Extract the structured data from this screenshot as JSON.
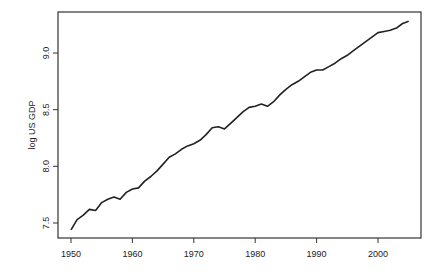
{
  "chart_data": {
    "type": "line",
    "title": "",
    "xlabel": "",
    "ylabel": "log US GDP",
    "xlim": [
      1948,
      2007
    ],
    "ylim": [
      7.37,
      9.36
    ],
    "grid": false,
    "legend": null,
    "x_ticks": [
      1950,
      1960,
      1970,
      1980,
      1990,
      2000
    ],
    "x_tick_labels": [
      "1950",
      "1960",
      "1970",
      "1980",
      "1990",
      "2000"
    ],
    "y_ticks": [
      7.5,
      8.0,
      8.5,
      9.0
    ],
    "y_tick_labels": [
      "7.5",
      "8.0",
      "8.5",
      "9.0"
    ],
    "series": [
      {
        "name": "log US GDP",
        "color": "#222222",
        "x": [
          1950,
          1951,
          1952,
          1953,
          1954,
          1955,
          1956,
          1957,
          1958,
          1959,
          1960,
          1961,
          1962,
          1963,
          1964,
          1965,
          1966,
          1967,
          1968,
          1969,
          1970,
          1971,
          1972,
          1973,
          1974,
          1975,
          1976,
          1977,
          1978,
          1979,
          1980,
          1981,
          1982,
          1983,
          1984,
          1985,
          1986,
          1987,
          1988,
          1989,
          1990,
          1991,
          1992,
          1993,
          1994,
          1995,
          1996,
          1997,
          1998,
          1999,
          2000,
          2001,
          2002,
          2003,
          2004,
          2005
        ],
        "values": [
          7.44,
          7.53,
          7.57,
          7.62,
          7.61,
          7.68,
          7.71,
          7.73,
          7.71,
          7.77,
          7.8,
          7.81,
          7.87,
          7.91,
          7.96,
          8.02,
          8.08,
          8.11,
          8.15,
          8.18,
          8.2,
          8.23,
          8.28,
          8.34,
          8.35,
          8.33,
          8.38,
          8.43,
          8.48,
          8.52,
          8.53,
          8.55,
          8.53,
          8.57,
          8.63,
          8.68,
          8.72,
          8.75,
          8.79,
          8.83,
          8.85,
          8.85,
          8.88,
          8.91,
          8.95,
          8.98,
          9.02,
          9.06,
          9.1,
          9.14,
          9.18,
          9.19,
          9.2,
          9.22,
          9.26,
          9.28
        ]
      }
    ]
  },
  "labels": {
    "ylabel": "log US GDP"
  }
}
